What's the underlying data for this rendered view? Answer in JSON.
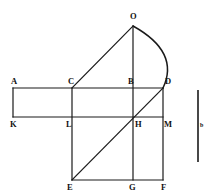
{
  "figure": {
    "background_color": "#ffffff",
    "stroke_color": "#1a1a1a",
    "width": 214,
    "height": 195,
    "points": [
      {
        "id": "O",
        "label": "O",
        "x": 133,
        "y": 26,
        "label_x": 130,
        "label_y": 12
      },
      {
        "id": "A",
        "label": "A",
        "x": 13,
        "y": 88,
        "label_x": 11,
        "label_y": 77
      },
      {
        "id": "C",
        "label": "C",
        "x": 72,
        "y": 88,
        "label_x": 68,
        "label_y": 77
      },
      {
        "id": "B",
        "label": "B",
        "x": 133,
        "y": 88,
        "label_x": 128,
        "label_y": 77
      },
      {
        "id": "D",
        "label": "D",
        "x": 163,
        "y": 88,
        "label_x": 165,
        "label_y": 77
      },
      {
        "id": "K",
        "label": "K",
        "x": 13,
        "y": 117,
        "label_x": 10,
        "label_y": 120
      },
      {
        "id": "L",
        "label": "L",
        "x": 72,
        "y": 117,
        "label_x": 66,
        "label_y": 120
      },
      {
        "id": "H",
        "label": "H",
        "x": 133,
        "y": 117,
        "label_x": 135,
        "label_y": 120
      },
      {
        "id": "M",
        "label": "M",
        "x": 163,
        "y": 117,
        "label_x": 164,
        "label_y": 120
      },
      {
        "id": "E",
        "label": "E",
        "x": 72,
        "y": 180,
        "label_x": 67,
        "label_y": 183
      },
      {
        "id": "G",
        "label": "G",
        "x": 133,
        "y": 180,
        "label_x": 129,
        "label_y": 183
      },
      {
        "id": "F",
        "label": "F",
        "x": 163,
        "y": 180,
        "label_x": 161,
        "label_y": 183
      }
    ],
    "segments": [
      {
        "name": "segment-A-D",
        "from": "A",
        "to": "D",
        "x1": 13,
        "y1": 88,
        "x2": 163,
        "y2": 88
      },
      {
        "name": "segment-K-M",
        "from": "K",
        "to": "M",
        "x1": 13,
        "y1": 117,
        "x2": 163,
        "y2": 117
      },
      {
        "name": "segment-E-F",
        "from": "E",
        "to": "F",
        "x1": 72,
        "y1": 180,
        "x2": 163,
        "y2": 180
      },
      {
        "name": "segment-A-K",
        "from": "A",
        "to": "K",
        "x1": 13,
        "y1": 88,
        "x2": 13,
        "y2": 117
      },
      {
        "name": "segment-C-E",
        "from": "C",
        "to": "E",
        "x1": 72,
        "y1": 88,
        "x2": 72,
        "y2": 180
      },
      {
        "name": "segment-O-G",
        "from": "O",
        "to": "G",
        "x1": 133,
        "y1": 26,
        "x2": 133,
        "y2": 180
      },
      {
        "name": "segment-D-F",
        "from": "D",
        "to": "F",
        "x1": 163,
        "y1": 88,
        "x2": 163,
        "y2": 180
      },
      {
        "name": "segment-C-O",
        "from": "C",
        "to": "O",
        "x1": 72,
        "y1": 88,
        "x2": 133,
        "y2": 26
      },
      {
        "name": "segment-E-D",
        "from": "E",
        "to": "D",
        "x1": 72,
        "y1": 180,
        "x2": 163,
        "y2": 88
      }
    ],
    "arc": {
      "name": "arc-O-D",
      "from": "O",
      "to": "D",
      "start_x": 133,
      "start_y": 26,
      "control_x": 180,
      "control_y": 52,
      "end_x": 163,
      "end_y": 88
    },
    "scale_bar": {
      "name": "scale-bar",
      "label": "b",
      "x": 198,
      "y_top": 90,
      "y_bottom": 162,
      "label_x": 200,
      "label_y": 122
    }
  }
}
